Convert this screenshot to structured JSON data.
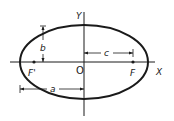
{
  "diagram": {
    "labels": {
      "y_axis": "Y",
      "x_axis": "X",
      "origin": "O",
      "focus_left": "F'",
      "focus_right": "F",
      "semi_minor": "b",
      "focal_distance": "c",
      "semi_major": "a"
    },
    "colors": {
      "stroke": "#1a1a1a",
      "background": "#ffffff"
    }
  }
}
